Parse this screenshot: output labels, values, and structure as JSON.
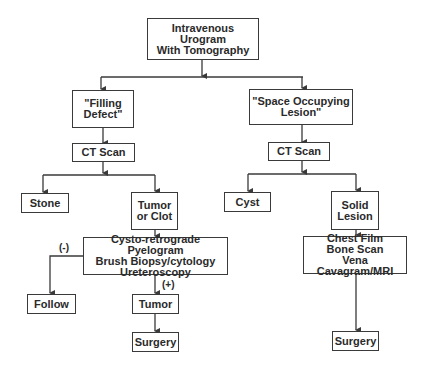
{
  "diagram": {
    "type": "flowchart",
    "line_color": "#3a3a3a",
    "nodes": {
      "root": "Intravenous Urogram\nWith Tomography",
      "filling_defect": "\"Filling\nDefect\"",
      "ct_left": "CT Scan",
      "space_lesion": "\"Space Occupying\nLesion\"",
      "ct_right": "CT Scan",
      "stone": "Stone",
      "tumor_clot": "Tumor\nor Clot",
      "cyst": "Cyst",
      "solid_lesion": "Solid\nLesion",
      "cysto": "Cysto-retrograde Pyelogram\nBrush Biopsy/cytology\nUreteroscopy",
      "chest": "Chest Film\nBone Scan\nVena Cavagram/MRI",
      "follow": "Follow",
      "tumor": "Tumor",
      "surgery_left": "Surgery",
      "surgery_right": "Surgery"
    },
    "edge_labels": {
      "negative": "(-)",
      "positive": "(+)"
    },
    "edges": [
      [
        "root",
        "filling_defect"
      ],
      [
        "root",
        "space_lesion"
      ],
      [
        "filling_defect",
        "ct_left"
      ],
      [
        "ct_left",
        "stone"
      ],
      [
        "ct_left",
        "tumor_clot"
      ],
      [
        "tumor_clot",
        "cysto"
      ],
      [
        "cysto",
        "follow",
        "(-)"
      ],
      [
        "cysto",
        "tumor",
        "(+)"
      ],
      [
        "tumor",
        "surgery_left"
      ],
      [
        "space_lesion",
        "ct_right"
      ],
      [
        "ct_right",
        "cyst"
      ],
      [
        "ct_right",
        "solid_lesion"
      ],
      [
        "solid_lesion",
        "chest"
      ],
      [
        "chest",
        "surgery_right"
      ]
    ]
  }
}
